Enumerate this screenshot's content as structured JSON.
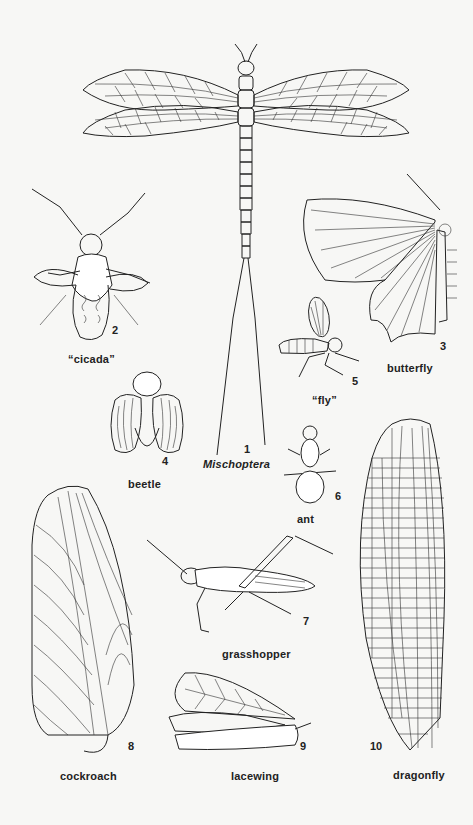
{
  "plate": {
    "background": "#f7f7f5",
    "ink": "#222222",
    "figures": [
      {
        "id": 1,
        "number": "1",
        "caption": "Mischoptera",
        "caption_style": "italic"
      },
      {
        "id": 2,
        "number": "2",
        "caption": "“cicada”"
      },
      {
        "id": 3,
        "number": "3",
        "caption": "butterfly"
      },
      {
        "id": 4,
        "number": "4",
        "caption": "beetle"
      },
      {
        "id": 5,
        "number": "5",
        "caption": "“fly”"
      },
      {
        "id": 6,
        "number": "6",
        "caption": "ant"
      },
      {
        "id": 7,
        "number": "7",
        "caption": "grasshopper"
      },
      {
        "id": 8,
        "number": "8",
        "caption": "cockroach"
      },
      {
        "id": 9,
        "number": "9",
        "caption": "lacewing"
      },
      {
        "id": 10,
        "number": "10",
        "caption": "dragonfly"
      }
    ]
  }
}
